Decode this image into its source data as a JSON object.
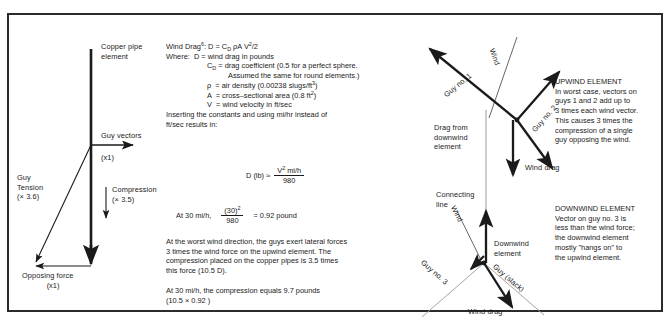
{
  "figure": {
    "left_diagram": {
      "pipe_label": "Copper pipe\nelement",
      "guy_vectors_label": "Guy vectors",
      "guy_vectors_mult": "(x1)",
      "guy_tension_label": "Guy\nTension\n(× 3.6)",
      "compression_label": "Compression",
      "compression_mult": "(× 3.5)",
      "opposing_label": "Opposing force",
      "opposing_mult": "(x1)"
    },
    "formulas": {
      "line1_a": "Wind Drag",
      "line1_sup": "6",
      "line1_b": ": D = C",
      "line1_sub": "D",
      "line1_c": " ρA V",
      "line1_sup2": "2",
      "line1_d": "/2",
      "line2": "Where:  D = wind drag in pounds",
      "line3_a": "C",
      "line3_sub": "D",
      "line3_b": " = drag coefficient (0.5 for a perfect sphere.",
      "line4": "Assumed the same for round elements.)",
      "line5_a": "ρ  = air density (0.00238 slugs/ft",
      "line5_sup": "3",
      "line5_b": ")",
      "line6_a": "A  = cross–sectional area (0.8 ft",
      "line6_sup": "2",
      "line6_b": ")",
      "line7": "V  = wind velocity in ft/sec",
      "line8": "Inserting the constants and using mi/hr instead of",
      "line9": "ft/sec results in:",
      "eq1_lhs": "D (lb)  ≈",
      "eq1_num_a": "V",
      "eq1_num_sup": "2",
      "eq1_num_b": " mi/h",
      "eq1_den": "980",
      "eq2_lhs": "At 30 mi/h,",
      "eq2_num_a": "(30)",
      "eq2_num_sup": "2",
      "eq2_den": "980",
      "eq2_rhs": "=  0.92 pound",
      "para1": "At the worst wind direction, the guys exert lateral forces\n3 times the wind force on the upwind element. The\ncompression placed on the copper pipes is 3.5 times\nthis force (10.5 D).",
      "para2": "At 30 mi/h, the compression equals 9.7 pounds\n(10.5 × 0.92 )"
    },
    "upwind_diagram": {
      "wind_label": "Wind",
      "guy1_label": "Guy no. 1",
      "guy2_label": "Guy no. 2",
      "drag_label": "Drag from\ndownwind\nelement",
      "wind_drag_label": "Wind drag",
      "connecting_label": "Connecting\nline"
    },
    "downwind_diagram": {
      "wind_label": "Wind",
      "guy3_label": "Guy no. 3",
      "guy_slack_label": "Guy (slack)",
      "element_label": "Downwind\nelement",
      "wind_drag_label": "Wind drag"
    },
    "upwind_note": {
      "title": "UPWIND ELEMENT",
      "body": "In worst case, vectors on\nguys 1 and 2 add up to\n3 times each wind vector.\nThis causes 3 times the\ncompression of a single\nguy opposing the wind."
    },
    "downwind_note": {
      "title": "DOWNWIND ELEMENT",
      "body": "Vector on guy no. 3 is\nless than the wind force;\nthe downwind element\nmostly \"hangs on\" to\nthe upwind element."
    }
  }
}
